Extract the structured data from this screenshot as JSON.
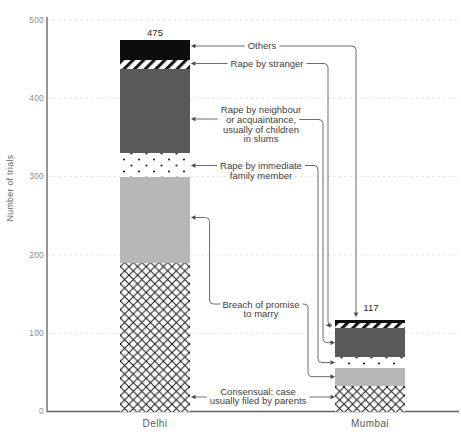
{
  "chart_data": {
    "type": "bar",
    "stacked": true,
    "title": "",
    "xlabel": "",
    "ylabel": "Number of trials",
    "ylim": [
      0,
      500
    ],
    "ytick_values": [
      0,
      100,
      200,
      300,
      400,
      500
    ],
    "ytick_labels": [
      "0",
      "100",
      "200",
      "300",
      "400",
      "500"
    ],
    "grid": "dashed-horizontal-gridlines",
    "legend_position": "inline-annotations-with-leader-arrows",
    "categories": [
      "Delhi",
      "Mumbai"
    ],
    "totals": [
      "475",
      "117"
    ],
    "series": [
      {
        "name": "Consensual: case usually filed by parents",
        "texture": "crosshatch",
        "values": [
          190,
          33
        ]
      },
      {
        "name": "Breach of promise to marry",
        "texture": "solid-light-gray",
        "values": [
          110,
          23
        ]
      },
      {
        "name": "Rape by immediate family member",
        "texture": "dots",
        "values": [
          30,
          13
        ]
      },
      {
        "name": "Rape by neighbour or acquaintance, usually of children in slums",
        "texture": "solid-dark-gray",
        "values": [
          108,
          38
        ]
      },
      {
        "name": "Rape by stranger",
        "texture": "diagonal-stripes",
        "values": [
          11,
          6
        ]
      },
      {
        "name": "Others",
        "texture": "solid-black",
        "values": [
          26,
          4
        ]
      }
    ],
    "annotation_labels": [
      {
        "id": "others",
        "lines": [
          "Others"
        ]
      },
      {
        "id": "rape-by-stranger",
        "lines": [
          "Rape by stranger"
        ]
      },
      {
        "id": "rape-by-neighbour",
        "lines": [
          "Rape by neighbour",
          "or acquaintance,",
          "usually of children",
          "in slums"
        ]
      },
      {
        "id": "rape-by-immediate-family",
        "lines": [
          "Rape by immediate",
          "family member"
        ]
      },
      {
        "id": "breach-of-promise",
        "lines": [
          "Breach of promise",
          "to marry"
        ]
      },
      {
        "id": "consensual",
        "lines": [
          "Consensual: case",
          "usually filed by parents"
        ]
      }
    ],
    "colors": {
      "dark_gray": "#58595b",
      "light_gray": "#b7b7b7",
      "black": "#0d0d0d",
      "pattern_ink": "#161616",
      "leader_line": "#6e6e6e",
      "arrow": "#4a4a4a",
      "text": "#414141",
      "tick_text": "#8c8c8c",
      "axis": "#5f5f5f",
      "gridline": "#dadada",
      "background": "#ffffff"
    }
  }
}
